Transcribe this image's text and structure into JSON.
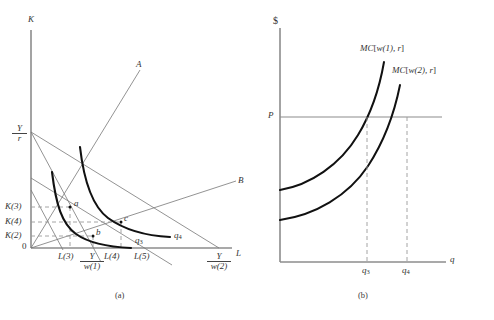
{
  "figure": {
    "panels": [
      {
        "id": "a",
        "caption": "(a)",
        "y_axis_label": "K",
        "x_axis_label": "L",
        "origin_label": "0",
        "y_intercept_label_num": "Y",
        "y_intercept_label_den": "r",
        "x_tick_labels": [
          "L(3)",
          "L(4)",
          "L(5)"
        ],
        "x_frac_tick_1_num": "Y",
        "x_frac_tick_1_den": "w(1)",
        "x_frac_tick_2_num": "Y",
        "x_frac_tick_2_den": "w(2)",
        "y_tick_labels": [
          "K(3)",
          "K(4)",
          "K(2)"
        ],
        "ray_labels": [
          "A",
          "B"
        ],
        "point_labels": [
          "a",
          "b",
          "c"
        ],
        "isoquant_labels": [
          {
            "base": "q",
            "sub": "3"
          },
          {
            "base": "q",
            "sub": "4"
          }
        ]
      },
      {
        "id": "b",
        "caption": "(b)",
        "y_axis_label": "$",
        "x_axis_label": "q",
        "price_label": "P",
        "curve_labels": [
          {
            "mc": "MC",
            "open": "[",
            "arg": "w(1), r",
            "close": "]"
          },
          {
            "mc": "MC",
            "open": "[",
            "arg": "w(2), r",
            "close": "]"
          }
        ],
        "x_tick_labels": [
          {
            "base": "q",
            "sub": "3"
          },
          {
            "base": "q",
            "sub": "4"
          }
        ]
      }
    ]
  },
  "colors": {
    "axis": "#8c8c8c",
    "thin_line": "#777777",
    "isoquant": "#111111",
    "dashed": "#9a9a9a",
    "mc_curve": "#111111",
    "price_line": "#8c8c8c",
    "text": "#333333",
    "background": "#ffffff"
  }
}
